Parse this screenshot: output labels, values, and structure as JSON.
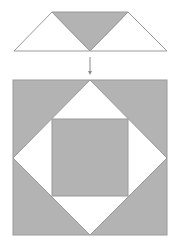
{
  "diagram": {
    "colors": {
      "gray_fill": "#b3b3b3",
      "white_fill": "#ffffff",
      "stroke": "#9a9a9a",
      "arrow": "#8a8a8a"
    },
    "top_unit": {
      "label": "flying-geese-unit",
      "pieces": [
        "white-left-triangle",
        "gray-center-triangle",
        "white-right-triangle"
      ]
    },
    "arrow": {
      "direction": "down"
    },
    "block": {
      "label": "square-in-a-square-block",
      "pieces": [
        "gray-outer-square",
        "white-diamond",
        "gray-inner-square"
      ]
    }
  }
}
